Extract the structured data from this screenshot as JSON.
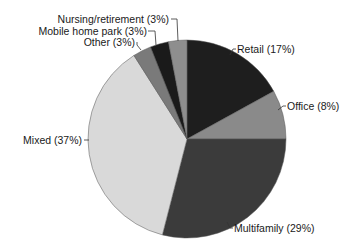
{
  "chart_data": {
    "type": "pie",
    "title": "",
    "start_angle": "12 o'clock, clockwise",
    "categories": [
      "Retail",
      "Office",
      "Multifamily",
      "Mixed",
      "Other",
      "Mobile home park",
      "Nursing/retirement"
    ],
    "values": [
      17,
      8,
      29,
      37,
      3,
      3,
      3
    ],
    "unit": "%",
    "labels": [
      "Retail (17%)",
      "Office (8%)",
      "Multifamily (29%)",
      "Mixed (37%)",
      "Other (3%)",
      "Mobile home park (3%)",
      "Nursing/retirement (3%)"
    ],
    "colors": [
      "#1e1e1e",
      "#8a8a8a",
      "#3b3b3b",
      "#d9d9d9",
      "#7a7a7a",
      "#1a1a1a",
      "#8e8e8e"
    ],
    "legend": "none (direct labels with leader lines)"
  }
}
